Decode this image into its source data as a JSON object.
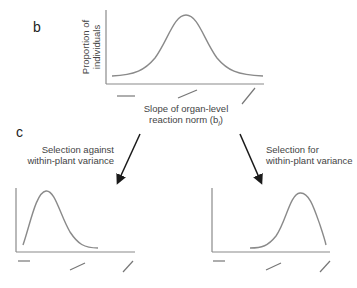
{
  "panels": {
    "b": {
      "label": "b",
      "ylabel_line1": "Proportion of",
      "ylabel_line2": "individuals",
      "xlabel_line1": "Slope of organ-level",
      "xlabel_line2": "reaction norm (b",
      "xlabel_subscript": "i",
      "xlabel_close": ")",
      "curve": "symmetric bell-shaped distribution centered at intermediate slope",
      "tick_glyphs": [
        "flat-slope",
        "shallow-slope",
        "steep-slope"
      ]
    },
    "c": {
      "label": "c",
      "left_arrow_label_line1": "Selection against",
      "left_arrow_label_line2": "within-plant variance",
      "right_arrow_label_line1": "Selection for",
      "right_arrow_label_line2": "within-plant variance",
      "left_curve": "distribution shifted toward flat slopes",
      "right_curve": "distribution shifted toward steep slopes",
      "tick_glyphs": [
        "flat-slope",
        "shallow-slope",
        "steep-slope"
      ]
    }
  },
  "colors": {
    "curve": "#8a8a8a",
    "axis": "#8a8a8a",
    "arrow": "#1a1a1a",
    "text": "#444444"
  }
}
